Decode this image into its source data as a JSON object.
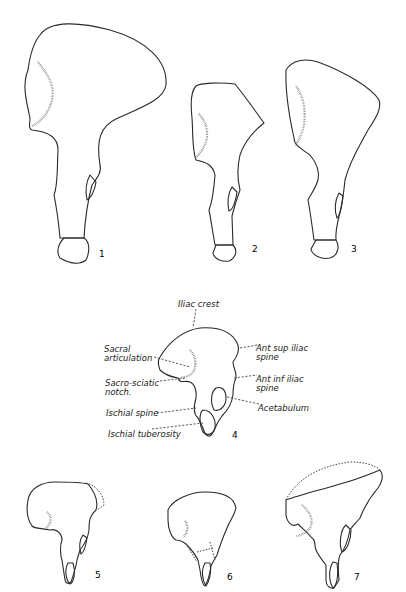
{
  "figure": {
    "type": "anatomical line drawing",
    "figure_numbers": [
      "1",
      "2",
      "3",
      "4",
      "5",
      "6",
      "7"
    ]
  },
  "labels": {
    "iliac_crest": "Iliac crest",
    "sacral_articulation_1": "Sacral",
    "sacral_articulation_2": "articulation",
    "sacro_sciatic_notch_1": "Sacro-sciatic",
    "sacro_sciatic_notch_2": "notch.",
    "ischial_spine": "Ischial spine",
    "ischial_tuberosity": "Ischial tuberosity",
    "ant_sup_iliac_spine_1": "Ant sup iliac",
    "ant_sup_iliac_spine_2": "spine",
    "ant_inf_iliac_spine_1": "Ant inf iliac",
    "ant_inf_iliac_spine_2": "spine",
    "acetabulum": "Acetabulum"
  },
  "colors": {
    "background": "#ffffff",
    "ink": "#2a2a2a"
  }
}
